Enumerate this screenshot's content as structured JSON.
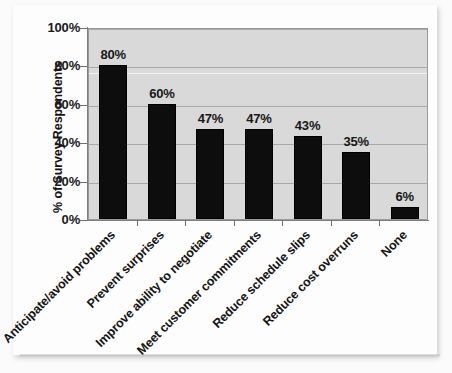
{
  "chart_data": {
    "type": "bar",
    "title": "",
    "subtitle": "",
    "xlabel": "",
    "ylabel": "% of Survey Respondents",
    "ylim": [
      0,
      100
    ],
    "grid": true,
    "legend": "none",
    "orientation": "vertical",
    "bar_color": "#0d0d0d",
    "plot_background": "#d9d9d9",
    "categories": [
      "Anticipate/avoid problems",
      "Prevent surprises",
      "Improve ability to negotiate",
      "Meet customer commitments",
      "Reduce schedule slips",
      "Reduce cost overruns",
      "None"
    ],
    "values": [
      80,
      60,
      47,
      47,
      43,
      35,
      6
    ],
    "data_labels": [
      "80%",
      "60%",
      "47%",
      "47%",
      "43%",
      "35%",
      "6%"
    ],
    "ytick_values": [
      0,
      20,
      40,
      60,
      80,
      100
    ],
    "ytick_labels": [
      "0%",
      "20%",
      "40%",
      "60%",
      "80%",
      "100%"
    ]
  }
}
